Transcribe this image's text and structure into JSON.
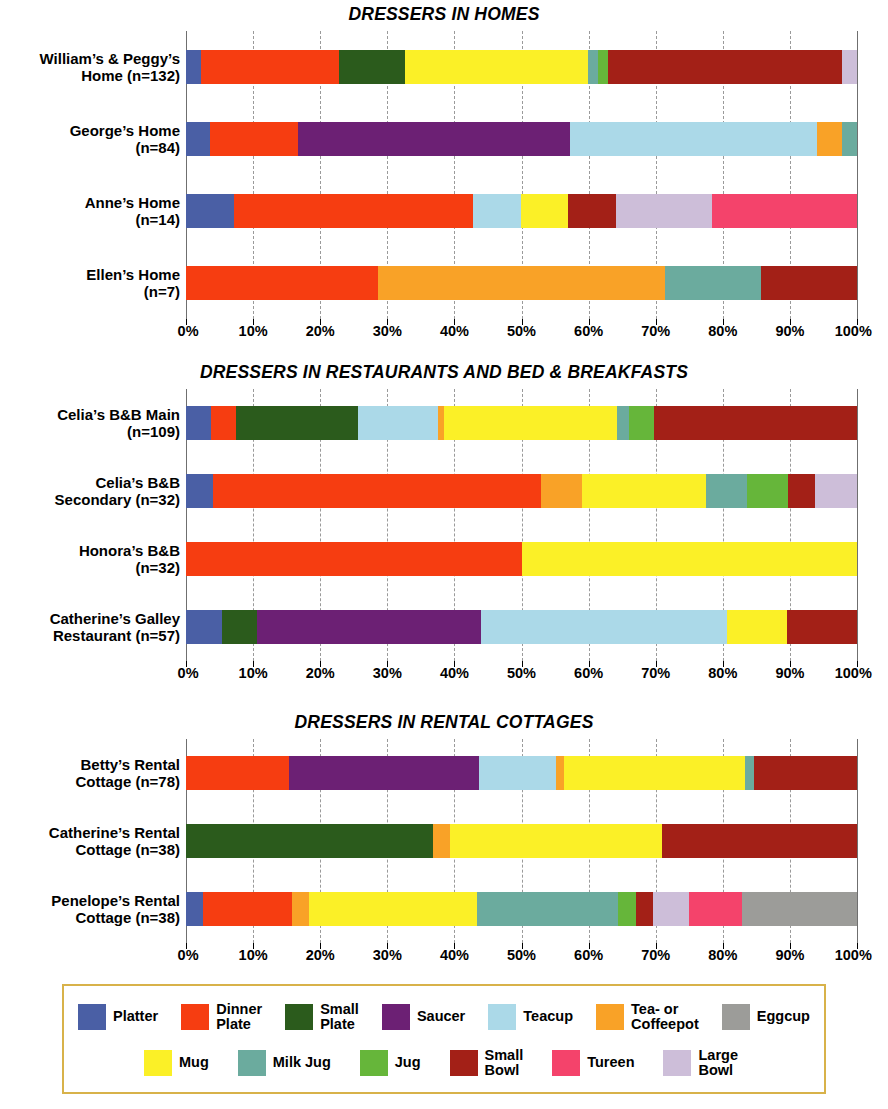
{
  "colors": {
    "platter": "#4a5fa5",
    "dinner_plate": "#f63d11",
    "small_plate": "#2b5b1c",
    "saucer": "#6c2074",
    "teacup": "#abd9e8",
    "tea_coffeepot": "#f9a227",
    "eggcup": "#9c9c99",
    "mug": "#fbf027",
    "milk_jug": "#6bab9e",
    "jug": "#66b63a",
    "small_bowl": "#a32017",
    "tureen": "#f4436b",
    "large_bowl": "#cdbed9",
    "grid": "#9a9a9a",
    "legend_border": "#d8b24a"
  },
  "axis": {
    "ticks": [
      "0%",
      "10%",
      "20%",
      "30%",
      "40%",
      "50%",
      "60%",
      "70%",
      "80%",
      "90%",
      "100%"
    ],
    "min": 0,
    "max": 100
  },
  "legend": {
    "row1": [
      {
        "key": "platter",
        "label": "Platter"
      },
      {
        "key": "dinner_plate",
        "label": "Dinner\nPlate"
      },
      {
        "key": "small_plate",
        "label": "Small\nPlate"
      },
      {
        "key": "saucer",
        "label": "Saucer"
      },
      {
        "key": "teacup",
        "label": "Teacup"
      },
      {
        "key": "tea_coffeepot",
        "label": "Tea- or\nCoffeepot"
      },
      {
        "key": "eggcup",
        "label": "Eggcup"
      }
    ],
    "row2": [
      {
        "key": "mug",
        "label": "Mug"
      },
      {
        "key": "milk_jug",
        "label": "Milk Jug"
      },
      {
        "key": "jug",
        "label": "Jug"
      },
      {
        "key": "small_bowl",
        "label": "Small\nBowl"
      },
      {
        "key": "tureen",
        "label": "Tureen"
      },
      {
        "key": "large_bowl",
        "label": "Large\nBowl"
      }
    ]
  },
  "chart_data": [
    {
      "type": "bar",
      "orientation": "horizontal",
      "stacked": true,
      "normalized_percent": true,
      "title": "DRESSERS IN HOMES",
      "xlabel": "",
      "ylabel": "",
      "xlim": [
        0,
        100
      ],
      "xticks": [
        0,
        10,
        20,
        30,
        40,
        50,
        60,
        70,
        80,
        90,
        100
      ],
      "grid": "vertical-dashed",
      "legend_position": "bottom",
      "categories": [
        "William’s & Peggy’s\nHome (n=132)",
        "George’s Home\n(n=84)",
        "Anne’s Home\n(n=14)",
        "Ellen’s Home\n(n=7)"
      ],
      "series_order": [
        "platter",
        "dinner_plate",
        "small_plate",
        "saucer",
        "teacup",
        "tea_coffeepot",
        "eggcup",
        "mug",
        "milk_jug",
        "jug",
        "small_bowl",
        "tureen",
        "large_bowl"
      ],
      "rows": [
        {
          "label": "William’s & Peggy’s\nHome (n=132)",
          "n": 132,
          "segments": [
            {
              "key": "platter",
              "value": 2.3
            },
            {
              "key": "dinner_plate",
              "value": 20.5
            },
            {
              "key": "small_plate",
              "value": 9.8
            },
            {
              "key": "mug",
              "value": 27.3
            },
            {
              "key": "milk_jug",
              "value": 1.5
            },
            {
              "key": "jug",
              "value": 1.5
            },
            {
              "key": "small_bowl",
              "value": 34.8
            },
            {
              "key": "large_bowl",
              "value": 2.3
            }
          ]
        },
        {
          "label": "George’s Home\n(n=84)",
          "n": 84,
          "segments": [
            {
              "key": "platter",
              "value": 3.6
            },
            {
              "key": "dinner_plate",
              "value": 13.1
            },
            {
              "key": "saucer",
              "value": 40.5
            },
            {
              "key": "teacup",
              "value": 36.9
            },
            {
              "key": "tea_coffeepot",
              "value": 3.6
            },
            {
              "key": "milk_jug",
              "value": 2.3
            }
          ]
        },
        {
          "label": "Anne’s Home\n(n=14)",
          "n": 14,
          "segments": [
            {
              "key": "platter",
              "value": 7.1
            },
            {
              "key": "dinner_plate",
              "value": 35.7
            },
            {
              "key": "teacup",
              "value": 7.1
            },
            {
              "key": "mug",
              "value": 7.1
            },
            {
              "key": "small_bowl",
              "value": 7.1
            },
            {
              "key": "large_bowl",
              "value": 14.3
            },
            {
              "key": "tureen",
              "value": 21.6
            }
          ]
        },
        {
          "label": "Ellen’s Home\n(n=7)",
          "n": 7,
          "segments": [
            {
              "key": "dinner_plate",
              "value": 28.6
            },
            {
              "key": "tea_coffeepot",
              "value": 42.8
            },
            {
              "key": "milk_jug",
              "value": 14.3
            },
            {
              "key": "small_bowl",
              "value": 14.3
            }
          ]
        }
      ]
    },
    {
      "type": "bar",
      "orientation": "horizontal",
      "stacked": true,
      "normalized_percent": true,
      "title": "DRESSERS IN RESTAURANTS AND BED & BREAKFASTS",
      "xlabel": "",
      "ylabel": "",
      "xlim": [
        0,
        100
      ],
      "xticks": [
        0,
        10,
        20,
        30,
        40,
        50,
        60,
        70,
        80,
        90,
        100
      ],
      "grid": "vertical-dashed",
      "legend_position": "bottom",
      "categories": [
        "Celia’s B&B Main\n(n=109)",
        "Celia’s B&B\nSecondary (n=32)",
        "Honora’s B&B\n(n=32)",
        "Catherine’s Galley\nRestaurant (n=57)"
      ],
      "rows": [
        {
          "label": "Celia’s B&B Main\n(n=109)",
          "n": 109,
          "segments": [
            {
              "key": "platter",
              "value": 3.7
            },
            {
              "key": "dinner_plate",
              "value": 3.7
            },
            {
              "key": "small_plate",
              "value": 18.3
            },
            {
              "key": "teacup",
              "value": 11.9
            },
            {
              "key": "tea_coffeepot",
              "value": 0.9
            },
            {
              "key": "mug",
              "value": 25.7
            },
            {
              "key": "milk_jug",
              "value": 1.8
            },
            {
              "key": "jug",
              "value": 3.7
            },
            {
              "key": "small_bowl",
              "value": 30.3
            }
          ]
        },
        {
          "label": "Celia’s B&B\nSecondary (n=32)",
          "n": 32,
          "segments": [
            {
              "key": "platter",
              "value": 3.1
            },
            {
              "key": "dinner_plate",
              "value": 37.5
            },
            {
              "key": "tea_coffeepot",
              "value": 4.7
            },
            {
              "key": "mug",
              "value": 14.1
            },
            {
              "key": "milk_jug",
              "value": 4.7
            },
            {
              "key": "jug",
              "value": 4.7
            },
            {
              "key": "small_bowl",
              "value": 3.1
            },
            {
              "key": "large_bowl",
              "value": 4.8
            }
          ]
        },
        {
          "label": "Honora’s B&B\n(n=32)",
          "n": 32,
          "segments": [
            {
              "key": "dinner_plate",
              "value": 50.0
            },
            {
              "key": "mug",
              "value": 50.0
            }
          ]
        },
        {
          "label": "Catherine’s Galley\nRestaurant (n=57)",
          "n": 57,
          "segments": [
            {
              "key": "platter",
              "value": 5.3
            },
            {
              "key": "small_plate",
              "value": 5.3
            },
            {
              "key": "saucer",
              "value": 33.3
            },
            {
              "key": "teacup",
              "value": 36.8
            },
            {
              "key": "mug",
              "value": 8.8
            },
            {
              "key": "small_bowl",
              "value": 10.5
            }
          ]
        }
      ]
    },
    {
      "type": "bar",
      "orientation": "horizontal",
      "stacked": true,
      "normalized_percent": true,
      "title": "DRESSERS IN RENTAL COTTAGES",
      "xlabel": "",
      "ylabel": "",
      "xlim": [
        0,
        100
      ],
      "xticks": [
        0,
        10,
        20,
        30,
        40,
        50,
        60,
        70,
        80,
        90,
        100
      ],
      "grid": "vertical-dashed",
      "legend_position": "bottom",
      "categories": [
        "Betty’s Rental\nCottage (n=78)",
        "Catherine’s Rental\nCottage (n=38)",
        "Penelope’s Rental\nCottage (n=38)"
      ],
      "rows": [
        {
          "label": "Betty’s Rental\nCottage (n=78)",
          "n": 78,
          "segments": [
            {
              "key": "dinner_plate",
              "value": 15.4
            },
            {
              "key": "saucer",
              "value": 28.2
            },
            {
              "key": "teacup",
              "value": 11.5
            },
            {
              "key": "tea_coffeepot",
              "value": 1.3
            },
            {
              "key": "mug",
              "value": 26.9
            },
            {
              "key": "milk_jug",
              "value": 1.3
            },
            {
              "key": "small_bowl",
              "value": 15.4
            }
          ]
        },
        {
          "label": "Catherine’s Rental\nCottage (n=38)",
          "n": 38,
          "segments": [
            {
              "key": "small_plate",
              "value": 36.8
            },
            {
              "key": "tea_coffeepot",
              "value": 2.6
            },
            {
              "key": "mug",
              "value": 31.6
            },
            {
              "key": "small_bowl",
              "value": 29.0
            }
          ]
        },
        {
          "label": "Penelope’s Rental\nCottage (n=38)",
          "n": 38,
          "segments": [
            {
              "key": "platter",
              "value": 2.6
            },
            {
              "key": "dinner_plate",
              "value": 13.2
            },
            {
              "key": "tea_coffeepot",
              "value": 2.6
            },
            {
              "key": "mug",
              "value": 24.9
            },
            {
              "key": "milk_jug",
              "value": 21.1
            },
            {
              "key": "jug",
              "value": 2.6
            },
            {
              "key": "small_bowl",
              "value": 2.6
            },
            {
              "key": "large_bowl",
              "value": 5.3
            },
            {
              "key": "tureen",
              "value": 7.9
            },
            {
              "key": "eggcup",
              "value": 17.2
            }
          ]
        }
      ]
    }
  ]
}
